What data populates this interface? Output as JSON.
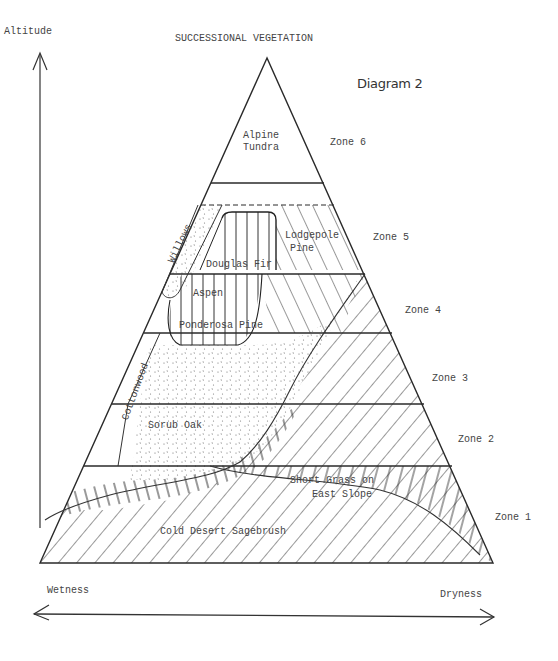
{
  "title": "SUCCESSIONAL VEGETATION",
  "diagram_label": "Diagram 2",
  "axes": {
    "vertical": "Altitude",
    "horizontal_left": "Wetness",
    "horizontal_right": "Dryness"
  },
  "zones": [
    {
      "id": "zone6",
      "label": "Zone 6"
    },
    {
      "id": "zone5",
      "label": "Zone 5"
    },
    {
      "id": "zone4",
      "label": "Zone 4"
    },
    {
      "id": "zone3",
      "label": "Zone 3"
    },
    {
      "id": "zone2",
      "label": "Zone 2"
    },
    {
      "id": "zone1",
      "label": "Zone 1"
    }
  ],
  "vegetation": {
    "alpine_line1": "Alpine",
    "alpine_line2": "Tundra",
    "lodgepole_line1": "Lodgepole",
    "lodgepole_line2": "Pine",
    "douglas_fir": "Douglas Fir",
    "willows": "Willows",
    "aspen": "Aspen",
    "ponderosa": "Ponderosa Pine",
    "cottonwood": "Cottonwood",
    "scrub_oak": "Sorub Oak",
    "short_grass_line1": "Short Grass on",
    "short_grass_line2": "East Slope",
    "sagebrush": "Cold Desert Sagebrush"
  },
  "colors": {
    "ink": "#2a2a2a",
    "paper": "#ffffff"
  }
}
